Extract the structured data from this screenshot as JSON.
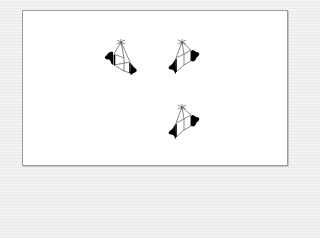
{
  "diagram": {
    "background_color": "#f0f0f0",
    "panel_color": "#ffffff",
    "panel_border_color": "#9a9a9a",
    "figures": [
      {
        "id": "top-left",
        "orientation": "lobes-left-and-lower-right",
        "x": 100,
        "y": 38
      },
      {
        "id": "top-right",
        "orientation": "lobes-lower-left-and-right",
        "x": 163,
        "y": 38
      },
      {
        "id": "bottom-right",
        "orientation": "lobes-lower-left-and-right",
        "x": 163,
        "y": 103
      }
    ],
    "line_color": "#555555",
    "fill_color": "#000000"
  }
}
